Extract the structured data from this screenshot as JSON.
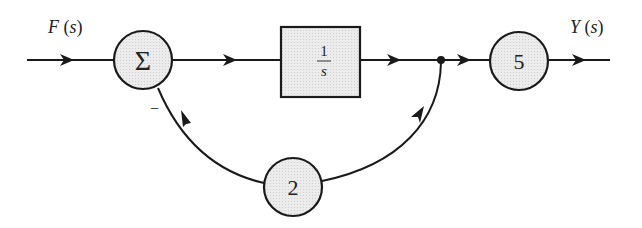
{
  "diagram": {
    "type": "block-diagram",
    "input_label": "F(s)",
    "input": {
      "name": "F",
      "arg": "s"
    },
    "output": {
      "name": "Y",
      "arg": "s"
    },
    "summer": {
      "symbol": "Σ",
      "feedback_sign": "−"
    },
    "integrator": {
      "numerator": "1",
      "denominator": "s"
    },
    "forward_gain": "5",
    "feedback_gain": "2",
    "colors": {
      "fill": "#e6e6e6",
      "stroke": "#1a1a1a",
      "text": "#222222"
    }
  }
}
